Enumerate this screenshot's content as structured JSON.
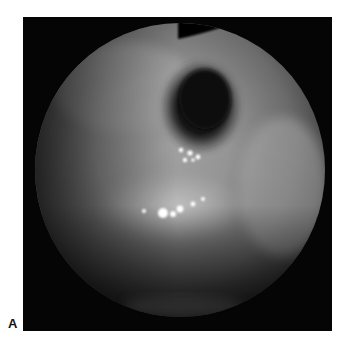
{
  "figure": {
    "panel_label": "A",
    "image_description": "Grayscale endoscopic view inside a circular field of view with a dark opening near the upper center and bright specular reflections",
    "colors": {
      "background": "#ffffff",
      "panel": "#050505",
      "tissue_light": "#b8b8b8",
      "tissue_mid": "#7a7a7a",
      "opening_dark": "#151515",
      "specular": "#ffffff"
    }
  }
}
